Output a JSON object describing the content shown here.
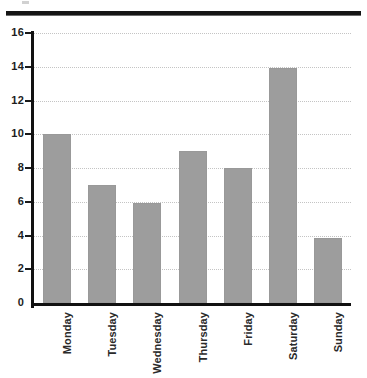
{
  "chart_data": {
    "type": "bar",
    "title": "",
    "subtitle": "",
    "xlabel": "",
    "ylabel": "",
    "categories": [
      "Monday",
      "Tuesday",
      "Wednesday",
      "Thursday",
      "Friday",
      "Saturday",
      "Sunday"
    ],
    "values": [
      10,
      7,
      5.9,
      9,
      8,
      13.9,
      3.85
    ],
    "ylim": [
      0,
      16
    ],
    "yticks": [
      0,
      2,
      4,
      6,
      8,
      10,
      12,
      14,
      16
    ],
    "ytick_labels": [
      "0",
      "2",
      "4",
      "6",
      "8",
      "10",
      "12",
      "14",
      "16"
    ],
    "grid": true,
    "grid_axis": "y",
    "grid_style": "dotted",
    "legend": false,
    "legend_position": "none",
    "bar_color": "#9d9d9d",
    "axis_color": "#111111",
    "grid_color": "#c4c4c4",
    "tick_label_color": "#1d1d1d",
    "category_label_color": "#2a2a2a",
    "category_label_rotation": 90,
    "background_color": "#ffffff"
  },
  "decorations": {
    "top_rule_color": "#151515",
    "scan_speck_color": "#c9c9c9"
  }
}
